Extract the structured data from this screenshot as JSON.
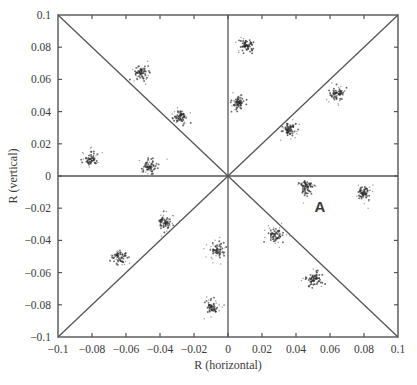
{
  "chart_data": {
    "type": "scatter",
    "title": "",
    "xlabel": "R (horizontal)",
    "ylabel": "R (vertical)",
    "xlim": [
      -0.1,
      0.1
    ],
    "ylim": [
      -0.1,
      0.1
    ],
    "grid": false,
    "legend": "none",
    "xticks": [
      {
        "value": -0.1,
        "label": "−0.1"
      },
      {
        "value": -0.08,
        "label": "−0.08"
      },
      {
        "value": -0.06,
        "label": "−0.06"
      },
      {
        "value": -0.04,
        "label": "−0.04"
      },
      {
        "value": -0.02,
        "label": "−0.02"
      },
      {
        "value": 0,
        "label": "0"
      },
      {
        "value": 0.02,
        "label": "0.02"
      },
      {
        "value": 0.04,
        "label": "0.04"
      },
      {
        "value": 0.06,
        "label": "0.06"
      },
      {
        "value": 0.08,
        "label": "0.08"
      },
      {
        "value": 0.1,
        "label": "0.1"
      }
    ],
    "yticks": [
      {
        "value": 0.1,
        "label": "0.1"
      },
      {
        "value": 0.08,
        "label": "0.08"
      },
      {
        "value": 0.06,
        "label": "0.06"
      },
      {
        "value": 0.04,
        "label": "0.04"
      },
      {
        "value": 0.02,
        "label": "0.02"
      },
      {
        "value": 0,
        "label": "0"
      },
      {
        "value": -0.02,
        "label": "−0.02"
      },
      {
        "value": -0.04,
        "label": "−0.04"
      },
      {
        "value": -0.06,
        "label": "−0.06"
      },
      {
        "value": -0.08,
        "label": "−0.08"
      },
      {
        "value": -0.1,
        "label": "−0.1"
      }
    ],
    "reference_lines": [
      {
        "name": "vertical-zero-line",
        "kind": "vertical",
        "x": 0
      },
      {
        "name": "horizontal-zero-line",
        "kind": "horizontal",
        "y": 0
      },
      {
        "name": "diagonal-line-positive",
        "kind": "diagonal",
        "slope": 1
      },
      {
        "name": "diagonal-line-negative",
        "kind": "diagonal",
        "slope": -1
      }
    ],
    "cluster_spread_sd": 0.0021,
    "points_per_cluster": 70,
    "clusters": [
      {
        "x": -0.051,
        "y": 0.064
      },
      {
        "x": -0.028,
        "y": 0.037
      },
      {
        "x": -0.081,
        "y": 0.011
      },
      {
        "x": -0.046,
        "y": 0.006
      },
      {
        "x": -0.037,
        "y": -0.029
      },
      {
        "x": -0.064,
        "y": -0.051
      },
      {
        "x": -0.006,
        "y": -0.046
      },
      {
        "x": -0.01,
        "y": -0.081
      },
      {
        "x": 0.011,
        "y": 0.081
      },
      {
        "x": 0.006,
        "y": 0.046
      },
      {
        "x": 0.064,
        "y": 0.051
      },
      {
        "x": 0.036,
        "y": 0.029
      },
      {
        "x": 0.046,
        "y": -0.007
      },
      {
        "x": 0.08,
        "y": -0.01
      },
      {
        "x": 0.028,
        "y": -0.037
      },
      {
        "x": 0.051,
        "y": -0.064
      }
    ],
    "annotations": [
      {
        "text": "A",
        "x": 0.054,
        "y": -0.019
      }
    ],
    "colors": {
      "line": "#555555",
      "point_dark": "#2b2b2b",
      "point_light": "#8a8a8a",
      "text": "#3a3a3a"
    }
  }
}
